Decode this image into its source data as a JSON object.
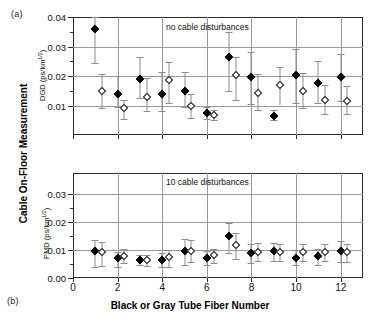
{
  "figure": {
    "panel_a_tag": "(a)",
    "panel_b_tag": "(b)",
    "outer_ylabel": "Cable On-Floor Measurement",
    "xlabel": "Black or Gray Tube Fiber Number"
  },
  "chart_data": [
    {
      "type": "scatter",
      "panel": "(a)",
      "title": "no cable disturbances",
      "annotation": "no cable disturbances",
      "xlabel": "Black or Gray Tube Fiber Number",
      "ylabel": "DGD (ps/km1/2)",
      "ylabel_base": "DGD (ps/km",
      "ylabel_exp": "1/2",
      "ylabel_tail": ")",
      "xlim": [
        0,
        13
      ],
      "ylim": [
        0,
        0.04
      ],
      "xticks": [
        0,
        2,
        4,
        6,
        8,
        10,
        12
      ],
      "xticklabels": [
        "0",
        "2",
        "4",
        "6",
        "8",
        "10",
        "12"
      ],
      "yticks": [
        0.01,
        0.02,
        0.03,
        0.04
      ],
      "yticklabels": [
        "0.01",
        "0.02",
        "0.03",
        "0.04"
      ],
      "grid": true,
      "legend": "none",
      "series": [
        {
          "name": "Black tube fiber",
          "marker": "filled-diamond",
          "x": [
            1,
            2,
            3,
            4,
            5,
            6,
            7,
            8,
            9,
            10,
            11,
            12
          ],
          "values": [
            0.036,
            0.014,
            0.019,
            0.014,
            0.015,
            0.0075,
            0.0265,
            0.0195,
            0.0065,
            0.0205,
            0.0175,
            0.0195
          ],
          "err_low": [
            0.0115,
            0.0045,
            0.0065,
            0.006,
            0.0055,
            0.002,
            0.0115,
            0.009,
            0.0015,
            0.0095,
            0.0065,
            0.008
          ],
          "err_high": [
            0.004,
            0.006,
            0.0075,
            0.0075,
            0.0065,
            0.002,
            0.0085,
            0.0085,
            0.002,
            0.0085,
            0.0075,
            0.008
          ]
        },
        {
          "name": "Gray tube fiber",
          "marker": "open-diamond",
          "x": [
            1.3,
            2.3,
            3.3,
            4.3,
            5.3,
            6.3,
            7.3,
            8.3,
            9.3,
            10.3,
            11.3,
            12.3
          ],
          "values": [
            0.015,
            0.009,
            0.0128,
            0.0188,
            0.0098,
            0.0067,
            0.0205,
            0.0143,
            0.017,
            0.015,
            0.012,
            0.0115
          ],
          "err_low": [
            0.0058,
            0.0035,
            0.0048,
            0.0078,
            0.004,
            0.0017,
            0.0085,
            0.0058,
            0.007,
            0.006,
            0.0048,
            0.0045
          ],
          "err_high": [
            0.0058,
            0.003,
            0.0065,
            0.0058,
            0.0042,
            0.0018,
            0.006,
            0.0065,
            0.006,
            0.006,
            0.005,
            0.005
          ]
        }
      ]
    },
    {
      "type": "scatter",
      "panel": "(b)",
      "title": "10 cable disturbances",
      "annotation": "10 cable disturbances",
      "xlabel": "Black or Gray Tube Fiber Number",
      "ylabel": "PMD (ps/km1/2)",
      "ylabel_base": "PMD (ps/km",
      "ylabel_exp": "1/2",
      "ylabel_tail": ")",
      "xlim": [
        0,
        13
      ],
      "ylim": [
        0,
        0.0375
      ],
      "xticks": [
        0,
        2,
        4,
        6,
        8,
        10,
        12
      ],
      "xticklabels": [
        "0",
        "2",
        "4",
        "6",
        "8",
        "10",
        "12"
      ],
      "yticks": [
        0.0,
        0.01,
        0.02,
        0.03
      ],
      "yticklabels": [
        "0.00",
        "0.01",
        "0.02",
        "0.03"
      ],
      "grid": true,
      "legend": "none",
      "series": [
        {
          "name": "Black tube fiber",
          "marker": "filled-diamond",
          "x": [
            1,
            2,
            3,
            4,
            5,
            6,
            7,
            8,
            9,
            10,
            11,
            12
          ],
          "values": [
            0.0097,
            0.007,
            0.0065,
            0.0066,
            0.0098,
            0.0073,
            0.015,
            0.009,
            0.0095,
            0.007,
            0.0077,
            0.0098
          ],
          "err_low": [
            0.0058,
            0.003,
            0.002,
            0.0028,
            0.005,
            0.0028,
            0.006,
            0.0035,
            0.0035,
            0.0025,
            0.003,
            0.004
          ],
          "err_high": [
            0.004,
            0.0022,
            0.0018,
            0.0022,
            0.004,
            0.0022,
            0.0048,
            0.003,
            0.003,
            0.003,
            0.0028,
            0.0035
          ]
        },
        {
          "name": "Gray tube fiber",
          "marker": "open-diamond",
          "x": [
            1.3,
            2.3,
            3.3,
            4.3,
            5.3,
            6.3,
            7.3,
            8.3,
            9.3,
            10.3,
            11.3,
            12.3
          ],
          "values": [
            0.0092,
            0.008,
            0.0064,
            0.0075,
            0.0098,
            0.0082,
            0.0118,
            0.0094,
            0.0092,
            0.0092,
            0.0092,
            0.0093
          ],
          "err_low": [
            0.0048,
            0.0028,
            0.002,
            0.0035,
            0.0042,
            0.003,
            0.005,
            0.0035,
            0.0032,
            0.0032,
            0.0032,
            0.0035
          ],
          "err_high": [
            0.0038,
            0.0022,
            0.0018,
            0.0025,
            0.0038,
            0.0022,
            0.0042,
            0.003,
            0.0028,
            0.0028,
            0.003,
            0.003
          ]
        }
      ]
    }
  ]
}
